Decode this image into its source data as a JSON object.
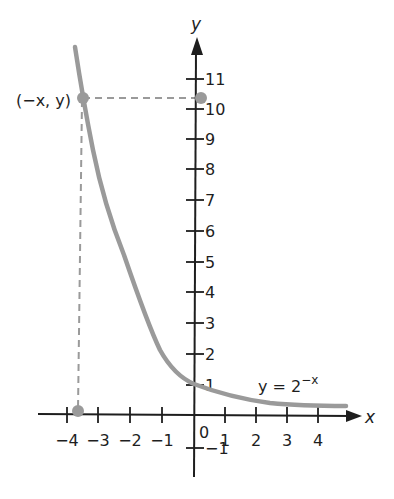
{
  "chart_data": {
    "type": "line",
    "title": "",
    "xlabel": "x",
    "ylabel": "y",
    "xlim": [
      -4,
      4.8
    ],
    "ylim": [
      -2,
      12
    ],
    "grid": false,
    "x_ticks": [
      "-4",
      "-3",
      "-2",
      "-1",
      "0",
      "1",
      "2",
      "3",
      "4"
    ],
    "y_ticks": [
      "-1",
      "1",
      "2",
      "3",
      "4",
      "5",
      "6",
      "7",
      "8",
      "9",
      "10",
      "11"
    ],
    "series": [
      {
        "name": "y = 2^-x",
        "x": [
          -3.8,
          -3.5,
          -3,
          -2.5,
          -2,
          -1.5,
          -1,
          -0.5,
          0,
          1,
          2,
          3,
          4,
          4.8
        ],
        "y": [
          11.3,
          10.4,
          8.0,
          6.0,
          4.0,
          2.8,
          1.8,
          1.3,
          1.0,
          0.5,
          0.25,
          0.13,
          0.06,
          0.04
        ]
      }
    ],
    "annotations": [
      {
        "label": "(−x, y)",
        "x": -3.5,
        "y": 10.4,
        "note": "point on curve with dashed projections to both axes"
      },
      {
        "label": "y = 2^−x",
        "x": 2.5,
        "y": 0.6
      }
    ],
    "legend": "none"
  },
  "labels": {
    "x_axis": "x",
    "y_axis": "y",
    "point": "(−x, y)",
    "equation_base": "y = 2",
    "equation_exp": "−x",
    "origin": "0",
    "x_ticks": [
      {
        "label": "−4",
        "px": 67
      },
      {
        "label": "−3",
        "px": 98
      },
      {
        "label": "−2",
        "px": 130
      },
      {
        "label": "−1",
        "px": 162
      },
      {
        "label": "1",
        "px": 225
      },
      {
        "label": "2",
        "px": 256
      },
      {
        "label": "3",
        "px": 287
      },
      {
        "label": "4",
        "px": 318
      }
    ],
    "y_ticks": [
      {
        "label": "11",
        "py": 79
      },
      {
        "label": "10",
        "py": 109
      },
      {
        "label": "9",
        "py": 139
      },
      {
        "label": "8",
        "py": 169
      },
      {
        "label": "7",
        "py": 200
      },
      {
        "label": "6",
        "py": 231
      },
      {
        "label": "5",
        "py": 262
      },
      {
        "label": "4",
        "py": 292
      },
      {
        "label": "3",
        "py": 323
      },
      {
        "label": "2",
        "py": 354
      },
      {
        "label": "1",
        "py": 385
      },
      {
        "label": "−1",
        "py": 448
      }
    ]
  },
  "colors": {
    "axis": "#1e1e1e",
    "curve": "#9a9a9a",
    "background": "#ffffff"
  }
}
